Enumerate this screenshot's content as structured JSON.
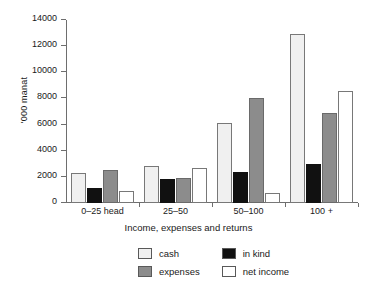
{
  "chart_data": {
    "type": "bar",
    "title": "",
    "xlabel": "Income, expenses and returns",
    "ylabel": "'000 manat",
    "categories": [
      "0–25 head",
      "25–50",
      "50–100",
      "100 +"
    ],
    "ylim": [
      0,
      14000
    ],
    "yticks": [
      0,
      2000,
      4000,
      6000,
      8000,
      10000,
      12000,
      14000
    ],
    "ytick_labels": [
      "0",
      "2000",
      "4000",
      "6000",
      "8000",
      "10000",
      "12000",
      "14000"
    ],
    "grid": false,
    "legend_position": "bottom",
    "series": [
      {
        "name": "cash",
        "color": "#f0f0f0",
        "values": [
          2300,
          2800,
          6100,
          12900
        ]
      },
      {
        "name": "in kind",
        "color": "#111111",
        "values": [
          1150,
          1800,
          2400,
          3000
        ]
      },
      {
        "name": "expenses",
        "color": "#8c8c8c",
        "values": [
          2500,
          1900,
          8000,
          6900
        ]
      },
      {
        "name": "net income",
        "color": "#ffffff",
        "values": [
          950,
          2700,
          750,
          8600
        ]
      }
    ]
  }
}
